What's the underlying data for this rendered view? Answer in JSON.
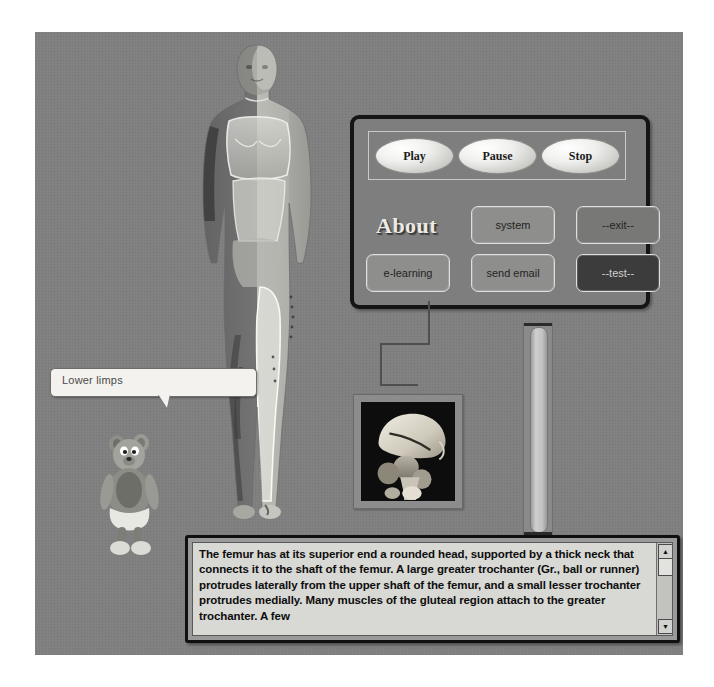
{
  "app": {
    "background_color": "#808080"
  },
  "transport": {
    "play_label": "Play",
    "pause_label": "Pause",
    "stop_label": "Stop"
  },
  "panel": {
    "about_label": "About",
    "system_label": "system",
    "exit_label": "--exit--",
    "elearning_label": "e-learning",
    "send_email_label": "send email",
    "test_label": "--test--",
    "border_color": "#151515"
  },
  "callout": {
    "label": "Lower limps"
  },
  "description": {
    "text": "The femur has at its superior end a rounded head, supported by a thick neck that connects it to the shaft of the femur. A large greater trochanter (Gr., ball or runner) protrudes laterally from the upper shaft of the femur, and a small lesser trochanter protrudes medially. Many muscles of the gluteal region attach to the greater trochanter. A few",
    "scroll_up_glyph": "▲",
    "scroll_down_glyph": "▼"
  },
  "figures": {
    "human_model": "anatomical-human-figure",
    "bone_image": "femur-pelvis-bone-render",
    "mascot": "cartoon-bear-mascot",
    "slider": "vertical-slider"
  }
}
